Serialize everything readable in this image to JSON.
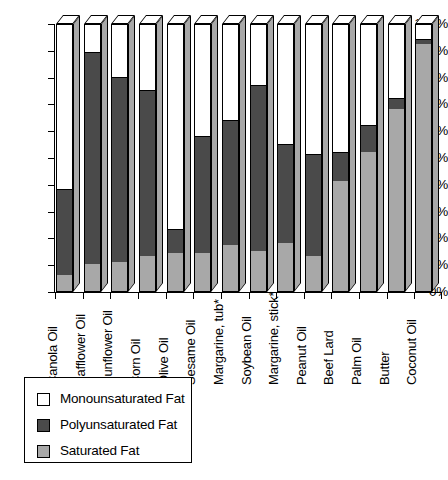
{
  "chart_data": {
    "type": "bar",
    "title": "",
    "subtitle": "",
    "xlabel": "",
    "ylabel": "",
    "stacked": true,
    "stack_total": 100,
    "ylim": [
      0,
      100
    ],
    "grid": false,
    "legend_position": "bottom-left",
    "y_tick_labels": [
      "100%",
      "90%",
      "80%",
      "70%",
      "60%",
      "50%",
      "40%",
      "30%",
      "20%",
      "10%",
      "0%"
    ],
    "y_tick_values": [
      100,
      90,
      80,
      70,
      60,
      50,
      40,
      30,
      20,
      10,
      0
    ],
    "categories": [
      "Canola Oil",
      "Safflower Oil",
      "Sunflower Oil",
      "Corn Oil",
      "Olive Oil",
      "Sesame Oil",
      "Margarine, tub*",
      "Soybean Oil",
      "Margarine, stick*",
      "Peanut Oil",
      "Beef Lard",
      "Palm Oil",
      "Butter",
      "Coconut Oil"
    ],
    "series": [
      {
        "name": "Saturated Fat",
        "color": "#a8a8a8",
        "values": [
          6,
          10,
          11,
          13,
          14,
          14,
          17,
          15,
          18,
          13,
          41,
          52,
          68,
          92
        ]
      },
      {
        "name": "Polyunsaturated Fat",
        "color": "#4a4a4a",
        "values": [
          32,
          79,
          69,
          62,
          9,
          44,
          47,
          62,
          37,
          38,
          11,
          10,
          4,
          2
        ]
      },
      {
        "name": "Monounsaturated Fat",
        "color": "#ffffff",
        "values": [
          62,
          11,
          20,
          25,
          77,
          42,
          36,
          23,
          45,
          49,
          48,
          38,
          28,
          6
        ]
      }
    ],
    "cumulative_tops": {
      "saturated": [
        6,
        10,
        11,
        13,
        14,
        14,
        17,
        15,
        18,
        13,
        41,
        52,
        68,
        92
      ],
      "saturated_plus_poly": [
        38,
        89,
        80,
        75,
        23,
        58,
        64,
        77,
        55,
        51,
        52,
        62,
        72,
        94
      ]
    },
    "footnote": "* margarine"
  },
  "legend": {
    "items": [
      {
        "label": "Monounsaturated Fat",
        "color": "#ffffff"
      },
      {
        "label": "Polyunsaturated Fat",
        "color": "#4a4a4a"
      },
      {
        "label": "Saturated Fat",
        "color": "#a8a8a8"
      }
    ]
  }
}
